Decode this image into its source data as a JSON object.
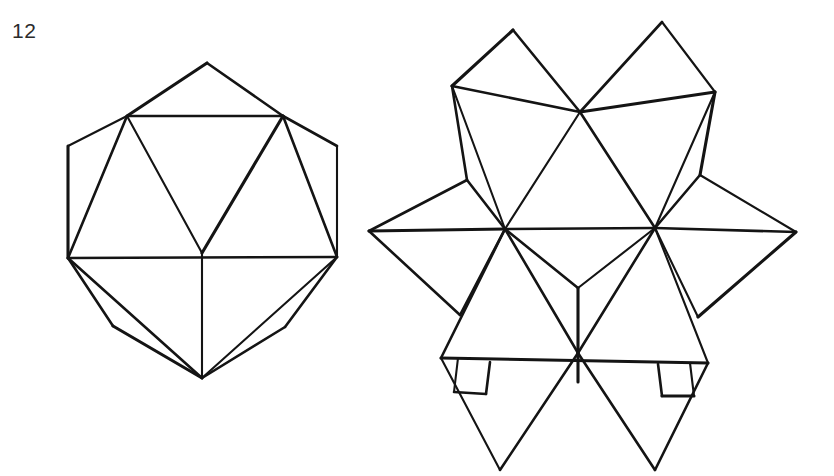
{
  "page": {
    "background_color": "#ffffff",
    "ink_color": "#141414",
    "width": 834,
    "height": 476
  },
  "figure": {
    "number_label": "12",
    "caption": "",
    "kind": "line-drawing"
  },
  "left_figure": {
    "name": "icosahedron",
    "outer_outline": "68,258 127,116 207,63 283,116 337,146 337,257 285,327 202,378 113,326",
    "vertices": {
      "top": [
        207,
        63
      ],
      "upper_left": [
        127,
        116
      ],
      "upper_right": [
        283,
        116
      ],
      "left": [
        68,
        258
      ],
      "right": [
        337,
        257
      ],
      "center": [
        202,
        253
      ],
      "bottom": [
        202,
        378
      ],
      "hex_left_upper": [
        68,
        146
      ],
      "hex_right_upper": [
        337,
        146
      ],
      "lower_left": [
        113,
        326
      ],
      "lower_right": [
        285,
        327
      ]
    },
    "edges": [
      [
        207,
        63,
        127,
        116
      ],
      [
        207,
        63,
        283,
        116
      ],
      [
        127,
        116,
        283,
        116
      ],
      [
        127,
        116,
        68,
        146
      ],
      [
        283,
        116,
        337,
        146
      ],
      [
        68,
        146,
        68,
        258
      ],
      [
        337,
        146,
        337,
        257
      ],
      [
        68,
        258,
        127,
        116
      ],
      [
        337,
        257,
        283,
        116
      ],
      [
        127,
        116,
        202,
        253
      ],
      [
        283,
        116,
        202,
        253
      ],
      [
        68,
        258,
        337,
        257
      ],
      [
        202,
        253,
        202,
        378
      ],
      [
        68,
        258,
        113,
        326
      ],
      [
        337,
        257,
        285,
        327
      ],
      [
        113,
        326,
        202,
        378
      ],
      [
        285,
        327,
        202,
        378
      ],
      [
        68,
        258,
        202,
        378
      ],
      [
        337,
        257,
        202,
        378
      ]
    ]
  },
  "right_figure": {
    "name": "stellated-icosahedron",
    "spike_tips": {
      "top_left": [
        513,
        30
      ],
      "top_right": [
        662,
        22
      ],
      "left": [
        369,
        231
      ],
      "right": [
        796,
        232
      ],
      "bottom_left": [
        500,
        470
      ],
      "bottom_right": [
        655,
        470
      ]
    },
    "hex_corners": {
      "upper_left": [
        452,
        86
      ],
      "upper_right": [
        715,
        92
      ],
      "mid_left_upper": [
        467,
        180
      ],
      "mid_right_upper": [
        700,
        175
      ],
      "mid_left_lower": [
        460,
        315
      ],
      "mid_right_lower": [
        698,
        317
      ],
      "lower_left": [
        441,
        358
      ],
      "lower_right": [
        708,
        363
      ]
    },
    "inner_vertices": {
      "top_center": [
        580,
        112
      ],
      "left": [
        505,
        229
      ],
      "right": [
        655,
        228
      ],
      "center_y": [
        578,
        288
      ],
      "bottom_center": [
        578,
        353
      ],
      "stub_end": [
        578,
        382
      ]
    },
    "edges": [
      [
        513,
        30,
        452,
        86
      ],
      [
        513,
        30,
        580,
        112
      ],
      [
        662,
        22,
        580,
        112
      ],
      [
        662,
        22,
        715,
        92
      ],
      [
        452,
        86,
        580,
        112
      ],
      [
        715,
        92,
        580,
        112
      ],
      [
        452,
        86,
        505,
        229
      ],
      [
        452,
        86,
        467,
        180
      ],
      [
        467,
        180,
        505,
        229
      ],
      [
        715,
        92,
        655,
        228
      ],
      [
        715,
        92,
        700,
        175
      ],
      [
        700,
        175,
        655,
        228
      ],
      [
        580,
        112,
        505,
        229
      ],
      [
        580,
        112,
        655,
        228
      ],
      [
        369,
        231,
        467,
        180
      ],
      [
        369,
        231,
        505,
        229
      ],
      [
        369,
        231,
        460,
        315
      ],
      [
        460,
        315,
        505,
        229
      ],
      [
        796,
        232,
        700,
        175
      ],
      [
        796,
        232,
        655,
        228
      ],
      [
        796,
        232,
        698,
        317
      ],
      [
        698,
        317,
        655,
        228
      ],
      [
        505,
        229,
        655,
        228
      ],
      [
        505,
        229,
        578,
        288
      ],
      [
        655,
        228,
        578,
        288
      ],
      [
        578,
        288,
        578,
        353
      ],
      [
        505,
        229,
        441,
        358
      ],
      [
        655,
        228,
        708,
        363
      ],
      [
        505,
        229,
        578,
        353
      ],
      [
        655,
        228,
        578,
        353
      ],
      [
        441,
        358,
        708,
        363
      ],
      [
        578,
        353,
        500,
        470
      ],
      [
        578,
        353,
        655,
        470
      ],
      [
        500,
        470,
        441,
        358
      ],
      [
        655,
        470,
        708,
        363
      ],
      [
        578,
        353,
        578,
        382
      ],
      [
        458,
        358,
        454,
        392
      ],
      [
        454,
        392,
        486,
        394
      ],
      [
        486,
        394,
        490,
        362
      ],
      [
        690,
        363,
        694,
        396
      ],
      [
        694,
        396,
        662,
        396
      ],
      [
        662,
        396,
        658,
        364
      ]
    ]
  }
}
